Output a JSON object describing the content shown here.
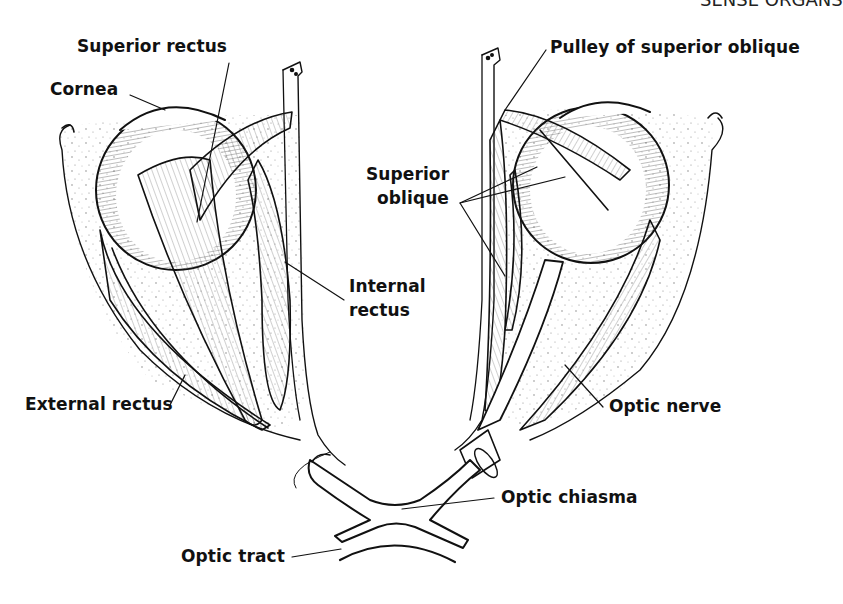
{
  "header": {
    "running_head": "SENSE ORGANS"
  },
  "figure": {
    "labels": {
      "superior_rectus": "Superior rectus",
      "cornea": "Cornea",
      "pulley_of_superior_oblique": "Pulley of superior oblique",
      "superior_oblique_line1": "Superior",
      "superior_oblique_line2": "oblique",
      "internal_rectus_line1": "Internal",
      "internal_rectus_line2": "rectus",
      "external_rectus": "External rectus",
      "optic_nerve": "Optic nerve",
      "optic_chiasma": "Optic chiasma",
      "optic_tract": "Optic tract"
    },
    "colors": {
      "ink": "#111111",
      "paper": "#ffffff",
      "stipple": "#9a9a9a"
    }
  }
}
